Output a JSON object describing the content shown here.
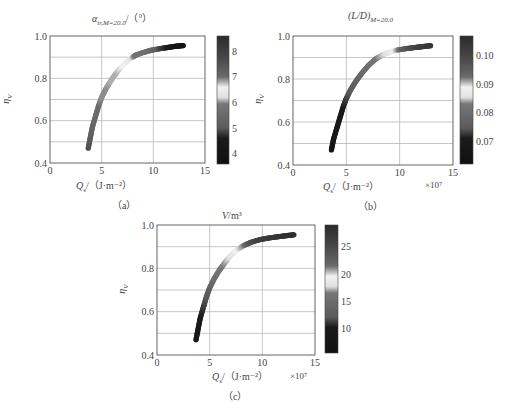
{
  "chart_data": [
    {
      "id": "a",
      "type": "scatter",
      "title": "α_tr,M=20.0 / (°)",
      "title_main": "α",
      "title_sub": "tr,M=20.0",
      "title_tail": "/（°）",
      "xlabel": "Q_s /（J·m⁻²）",
      "xlabel_var": "Q",
      "xlabel_sub": "s",
      "xlabel_unit": "/（J·m⁻²）",
      "x_multiplier": "",
      "ylabel": "η_V",
      "xlim": [
        0,
        15
      ],
      "ylim": [
        0.4,
        1.0
      ],
      "xticks": [
        0,
        5,
        10,
        15
      ],
      "yticks": [
        0.4,
        0.6,
        0.8,
        1.0
      ],
      "ytick_labels": [
        "0.4",
        "0.6",
        "0.8",
        "1.0"
      ],
      "grid": true,
      "caption": "（a）",
      "colorbar": {
        "label": "α_tr,M=20.0 (°)",
        "range": [
          3.6,
          8.6
        ],
        "ticks": [
          4,
          5,
          6,
          7,
          8
        ],
        "stops": [
          {
            "pos": 0.0,
            "color": "#2a2a2a"
          },
          {
            "pos": 0.18,
            "color": "#4a4a4a"
          },
          {
            "pos": 0.32,
            "color": "#6a6a6a"
          },
          {
            "pos": 0.4,
            "color": "#f2f2f2"
          },
          {
            "pos": 0.48,
            "color": "#e0e0e0"
          },
          {
            "pos": 0.53,
            "color": "#777777"
          },
          {
            "pos": 0.72,
            "color": "#5a5a5a"
          },
          {
            "pos": 0.8,
            "color": "#1a1a1a"
          },
          {
            "pos": 1.0,
            "color": "#111111"
          }
        ]
      },
      "points": [
        {
          "x": 3.7,
          "y": 0.47,
          "c": 7.6
        },
        {
          "x": 3.9,
          "y": 0.52,
          "c": 7.3
        },
        {
          "x": 4.1,
          "y": 0.57,
          "c": 7.1
        },
        {
          "x": 4.4,
          "y": 0.62,
          "c": 7.0
        },
        {
          "x": 4.7,
          "y": 0.67,
          "c": 7.0
        },
        {
          "x": 5.0,
          "y": 0.71,
          "c": 6.9
        },
        {
          "x": 5.4,
          "y": 0.75,
          "c": 6.9
        },
        {
          "x": 5.9,
          "y": 0.79,
          "c": 6.8
        },
        {
          "x": 6.4,
          "y": 0.825,
          "c": 6.8
        },
        {
          "x": 7.0,
          "y": 0.86,
          "c": 6.6
        },
        {
          "x": 7.7,
          "y": 0.89,
          "c": 6.4
        },
        {
          "x": 8.3,
          "y": 0.91,
          "c": 5.8
        },
        {
          "x": 9.0,
          "y": 0.922,
          "c": 5.7
        },
        {
          "x": 9.8,
          "y": 0.933,
          "c": 5.5
        },
        {
          "x": 10.6,
          "y": 0.94,
          "c": 4.9
        },
        {
          "x": 11.4,
          "y": 0.946,
          "c": 4.6
        },
        {
          "x": 12.2,
          "y": 0.952,
          "c": 4.2
        },
        {
          "x": 12.9,
          "y": 0.955,
          "c": 3.9
        }
      ]
    },
    {
      "id": "b",
      "type": "scatter",
      "title": "(L/D)_M=20.0",
      "title_main": "(L/D)",
      "title_sub": "M=20.0",
      "title_tail": "",
      "xlabel": "Q_s /（J·m⁻²）",
      "xlabel_var": "Q",
      "xlabel_sub": "s",
      "xlabel_unit": "/（J·m⁻²）",
      "x_multiplier": "×10⁷",
      "ylabel": "η_V",
      "xlim": [
        0,
        15
      ],
      "ylim": [
        0.4,
        1.0
      ],
      "xticks": [
        0,
        5,
        10,
        15
      ],
      "yticks": [
        0.4,
        0.6,
        0.8,
        1.0
      ],
      "ytick_labels": [
        "0.4",
        "0.6",
        "0.8",
        "1.0"
      ],
      "grid": true,
      "caption": "（b）",
      "colorbar": {
        "label": "(L/D)_M=20.0",
        "range": [
          0.062,
          0.107
        ],
        "ticks": [
          0.07,
          0.08,
          0.09,
          0.1
        ],
        "tick_labels": [
          "0.07",
          "0.08",
          "0.09",
          "0.10"
        ],
        "stops": [
          {
            "pos": 0.0,
            "color": "#2a2a2a"
          },
          {
            "pos": 0.18,
            "color": "#4a4a4a"
          },
          {
            "pos": 0.32,
            "color": "#6a6a6a"
          },
          {
            "pos": 0.4,
            "color": "#f2f2f2"
          },
          {
            "pos": 0.48,
            "color": "#e0e0e0"
          },
          {
            "pos": 0.53,
            "color": "#777777"
          },
          {
            "pos": 0.72,
            "color": "#5a5a5a"
          },
          {
            "pos": 0.8,
            "color": "#1a1a1a"
          },
          {
            "pos": 1.0,
            "color": "#111111"
          }
        ]
      },
      "points": [
        {
          "x": 3.6,
          "y": 0.47,
          "c": 0.066
        },
        {
          "x": 3.8,
          "y": 0.52,
          "c": 0.068
        },
        {
          "x": 4.1,
          "y": 0.57,
          "c": 0.069
        },
        {
          "x": 4.4,
          "y": 0.62,
          "c": 0.07
        },
        {
          "x": 4.7,
          "y": 0.67,
          "c": 0.071
        },
        {
          "x": 5.0,
          "y": 0.71,
          "c": 0.073
        },
        {
          "x": 5.4,
          "y": 0.75,
          "c": 0.075
        },
        {
          "x": 5.9,
          "y": 0.79,
          "c": 0.077
        },
        {
          "x": 6.5,
          "y": 0.83,
          "c": 0.079
        },
        {
          "x": 7.1,
          "y": 0.865,
          "c": 0.081
        },
        {
          "x": 7.8,
          "y": 0.895,
          "c": 0.083
        },
        {
          "x": 8.5,
          "y": 0.915,
          "c": 0.085
        },
        {
          "x": 9.2,
          "y": 0.928,
          "c": 0.087
        },
        {
          "x": 9.9,
          "y": 0.936,
          "c": 0.092
        },
        {
          "x": 10.7,
          "y": 0.942,
          "c": 0.097
        },
        {
          "x": 11.5,
          "y": 0.947,
          "c": 0.1
        },
        {
          "x": 12.2,
          "y": 0.951,
          "c": 0.102
        },
        {
          "x": 12.9,
          "y": 0.955,
          "c": 0.104
        }
      ]
    },
    {
      "id": "c",
      "type": "scatter",
      "title": "V/m³",
      "title_main": "V",
      "title_sub": "",
      "title_tail": "/m³",
      "xlabel": "Q_s /（J·m⁻²）",
      "xlabel_var": "Q",
      "xlabel_sub": "s",
      "xlabel_unit": "/（J·m⁻²）",
      "x_multiplier": "×10⁷",
      "ylabel": "η_V",
      "xlim": [
        0,
        15
      ],
      "ylim": [
        0.4,
        1.0
      ],
      "xticks": [
        0,
        5,
        10,
        15
      ],
      "yticks": [
        0.4,
        0.6,
        0.8,
        1.0
      ],
      "ytick_labels": [
        "0.4",
        "0.6",
        "0.8",
        "1.0"
      ],
      "grid": true,
      "caption": "（c）",
      "colorbar": {
        "label": "V (m³)",
        "range": [
          5.5,
          29
        ],
        "ticks": [
          10,
          15,
          20,
          25
        ],
        "tick_labels": [
          "10",
          "15",
          "20",
          "25"
        ],
        "stops": [
          {
            "pos": 0.0,
            "color": "#2a2a2a"
          },
          {
            "pos": 0.18,
            "color": "#4a4a4a"
          },
          {
            "pos": 0.32,
            "color": "#6a6a6a"
          },
          {
            "pos": 0.4,
            "color": "#f2f2f2"
          },
          {
            "pos": 0.48,
            "color": "#e0e0e0"
          },
          {
            "pos": 0.53,
            "color": "#777777"
          },
          {
            "pos": 0.72,
            "color": "#5a5a5a"
          },
          {
            "pos": 0.8,
            "color": "#1a1a1a"
          },
          {
            "pos": 1.0,
            "color": "#111111"
          }
        ]
      },
      "points": [
        {
          "x": 3.7,
          "y": 0.47,
          "c": 9
        },
        {
          "x": 3.9,
          "y": 0.52,
          "c": 9.5
        },
        {
          "x": 4.1,
          "y": 0.57,
          "c": 10
        },
        {
          "x": 4.4,
          "y": 0.62,
          "c": 11
        },
        {
          "x": 4.7,
          "y": 0.67,
          "c": 12
        },
        {
          "x": 5.0,
          "y": 0.71,
          "c": 13
        },
        {
          "x": 5.4,
          "y": 0.75,
          "c": 15
        },
        {
          "x": 5.9,
          "y": 0.79,
          "c": 16
        },
        {
          "x": 6.5,
          "y": 0.83,
          "c": 17
        },
        {
          "x": 7.0,
          "y": 0.86,
          "c": 18
        },
        {
          "x": 7.6,
          "y": 0.885,
          "c": 19.5
        },
        {
          "x": 8.2,
          "y": 0.905,
          "c": 21
        },
        {
          "x": 8.9,
          "y": 0.92,
          "c": 24
        },
        {
          "x": 9.7,
          "y": 0.932,
          "c": 26
        },
        {
          "x": 10.6,
          "y": 0.94,
          "c": 27
        },
        {
          "x": 11.5,
          "y": 0.946,
          "c": 27.5
        },
        {
          "x": 12.3,
          "y": 0.951,
          "c": 28
        },
        {
          "x": 13.0,
          "y": 0.955,
          "c": 28.5
        }
      ]
    }
  ],
  "layout": {
    "panels": [
      {
        "id": "a",
        "plot": {
          "x": 50,
          "y": 36,
          "w": 155,
          "h": 127
        },
        "cbar": {
          "x": 217,
          "y": 36,
          "w": 12,
          "h": 128
        }
      },
      {
        "id": "b",
        "plot": {
          "x": 293,
          "y": 36,
          "w": 160,
          "h": 129
        },
        "cbar": {
          "x": 460,
          "y": 36,
          "w": 13,
          "h": 128
        }
      },
      {
        "id": "c",
        "plot": {
          "x": 157,
          "y": 225,
          "w": 158,
          "h": 130
        },
        "cbar": {
          "x": 325,
          "y": 225,
          "w": 13,
          "h": 128
        }
      }
    ]
  }
}
